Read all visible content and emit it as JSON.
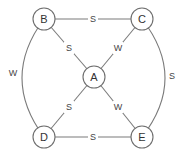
{
  "diagram": {
    "nodes": [
      {
        "id": "A",
        "label": "A"
      },
      {
        "id": "B",
        "label": "B"
      },
      {
        "id": "C",
        "label": "C"
      },
      {
        "id": "D",
        "label": "D"
      },
      {
        "id": "E",
        "label": "E"
      }
    ],
    "edges": [
      {
        "from": "B",
        "to": "C",
        "label": "S"
      },
      {
        "from": "B",
        "to": "A",
        "label": "S"
      },
      {
        "from": "C",
        "to": "A",
        "label": "W"
      },
      {
        "from": "B",
        "to": "D",
        "label": "W"
      },
      {
        "from": "C",
        "to": "E",
        "label": "S"
      },
      {
        "from": "A",
        "to": "D",
        "label": "S"
      },
      {
        "from": "A",
        "to": "E",
        "label": "W"
      },
      {
        "from": "D",
        "to": "E",
        "label": "S"
      }
    ]
  }
}
